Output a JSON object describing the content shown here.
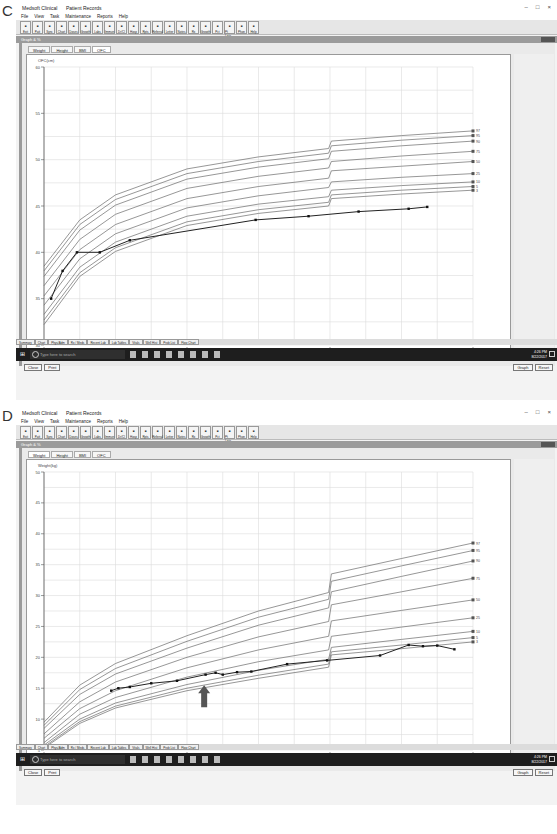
{
  "panels": [
    {
      "letter": "C",
      "app": {
        "title": "Medsoft Clinical",
        "subtitle": "Patient Records",
        "window_controls": [
          "–",
          "□",
          "×"
        ],
        "menu": [
          "File",
          "View",
          "Task",
          "Maintenance",
          "Reports",
          "Help"
        ],
        "toolbar": [
          "Exit",
          "Patt",
          "Sync",
          "Chart",
          "Doses",
          "Growth",
          "Labs",
          "Immun",
          "Dr/Cl",
          "Hosp",
          "Rpts",
          "Referral",
          "Letter",
          "Notes",
          "Rx",
          "Growth",
          "Pct",
          "Pt Lists",
          "Phon",
          "Help"
        ],
        "graph_window_title": "Graph & %",
        "tabs": [
          "Weight",
          "Height",
          "BMI",
          "OFC"
        ],
        "active_tab": "OFC",
        "status_line": "R. R.  ID: ###   DOB: 07/30/2015   Sex: M   08/22/17",
        "buttons_left": [
          "Close",
          "Print"
        ],
        "buttons_right": [
          "Graph",
          "Reset"
        ],
        "bottom_tabs": [
          "Summary",
          "Chart",
          "Phys/Adm",
          "Rx / Meds",
          "Recent Lab",
          "Lab Tables",
          "Vitals",
          "Well Hist",
          "Prob List",
          "Flow Chart"
        ],
        "taskbar": {
          "search_placeholder": "Type here to search",
          "time": "4:26 PM",
          "date": "8/22/2017"
        }
      }
    },
    {
      "letter": "D",
      "app": {
        "title": "Medsoft Clinical",
        "subtitle": "Patient Records",
        "window_controls": [
          "–",
          "□",
          "×"
        ],
        "menu": [
          "File",
          "View",
          "Task",
          "Maintenance",
          "Reports",
          "Help"
        ],
        "toolbar": [
          "Exit",
          "Patt",
          "Sync",
          "Chart",
          "Doses",
          "Growth",
          "Labs",
          "Immun",
          "Dr/Cl",
          "Hosp",
          "Rpts",
          "Referral",
          "Letter",
          "Notes",
          "Rx",
          "Growth",
          "Pct",
          "Pt Lists",
          "Phon",
          "Help"
        ],
        "graph_window_title": "Graph & %",
        "tabs": [
          "Weight",
          "Height",
          "BMI",
          "OFC"
        ],
        "active_tab": "Weight",
        "status_line": "R. R.  ID: ###   DOB: 09/09/2011   Sex: M   08/22/17",
        "buttons_left": [
          "Close",
          "Print"
        ],
        "buttons_right": [
          "Graph",
          "Reset"
        ],
        "bottom_tabs": [
          "Summary",
          "Chart",
          "Phys/Adm",
          "Rx / Meds",
          "Recent Lab",
          "Lab Tables",
          "Vitals",
          "Well Hist",
          "Prob List",
          "Flow Chart"
        ],
        "taskbar": {
          "search_placeholder": "Type here to search",
          "time": "4:26 PM",
          "date": "8/22/2017"
        }
      }
    }
  ],
  "chart_data": [
    {
      "panel": "C",
      "type": "line",
      "title": "OFC growth chart",
      "ylabel": "OFC(cm)",
      "xlabel": "Age(years)",
      "ylim": [
        30,
        60
      ],
      "xlim": [
        0,
        3
      ],
      "y_ticks": [
        30,
        35,
        40,
        45,
        50,
        55,
        60
      ],
      "x_ticks": [
        0,
        1,
        2,
        3
      ],
      "grid": true,
      "legend_position": "right-end labels",
      "percentile_labels": [
        "97",
        "95",
        "90",
        "75",
        "50",
        "25",
        "10",
        "5",
        "3"
      ],
      "x": [
        0,
        0.25,
        0.5,
        1,
        1.5,
        1.99,
        2.01,
        2.5,
        3
      ],
      "series": [
        {
          "name": "97",
          "values": [
            38.5,
            43.5,
            46.2,
            49.0,
            50.3,
            51.2,
            52.0,
            52.6,
            53.1
          ]
        },
        {
          "name": "95",
          "values": [
            38.0,
            43.0,
            45.7,
            48.5,
            49.8,
            50.7,
            51.5,
            52.1,
            52.6
          ]
        },
        {
          "name": "90",
          "values": [
            37.4,
            42.4,
            45.1,
            47.9,
            49.2,
            50.1,
            50.9,
            51.5,
            52.0
          ]
        },
        {
          "name": "75",
          "values": [
            36.4,
            41.4,
            44.1,
            46.9,
            48.2,
            49.1,
            49.8,
            50.4,
            50.9
          ]
        },
        {
          "name": "50",
          "values": [
            35.3,
            40.3,
            43.0,
            45.8,
            47.1,
            48.0,
            48.8,
            49.3,
            49.8
          ]
        },
        {
          "name": "25",
          "values": [
            34.3,
            39.3,
            42.0,
            44.8,
            46.1,
            47.0,
            47.6,
            48.1,
            48.5
          ]
        },
        {
          "name": "10",
          "values": [
            33.3,
            38.4,
            41.1,
            43.9,
            45.2,
            46.0,
            46.7,
            47.2,
            47.6
          ]
        },
        {
          "name": "5",
          "values": [
            32.7,
            37.8,
            40.5,
            43.3,
            44.6,
            45.4,
            46.2,
            46.7,
            47.1
          ]
        },
        {
          "name": "3",
          "values": [
            32.2,
            37.4,
            40.1,
            42.9,
            44.2,
            45.0,
            45.8,
            46.3,
            46.7
          ]
        }
      ],
      "patient": {
        "name": "Patient OFC",
        "x": [
          0.05,
          0.13,
          0.23,
          0.39,
          0.6,
          1.48,
          1.85,
          2.2,
          2.55,
          2.68
        ],
        "y": [
          35.0,
          38.0,
          40.0,
          40.0,
          41.3,
          43.5,
          43.9,
          44.4,
          44.7,
          44.9
        ]
      }
    },
    {
      "panel": "D",
      "type": "line",
      "title": "Weight growth chart",
      "ylabel": "Weight(kg)",
      "xlabel": "Age(years)",
      "ylim": [
        5,
        50
      ],
      "xlim": [
        0,
        3
      ],
      "y_ticks": [
        5,
        10,
        15,
        20,
        25,
        30,
        35,
        40,
        45,
        50
      ],
      "x_ticks": [
        0,
        1,
        2,
        3
      ],
      "grid": true,
      "legend_position": "right-end labels",
      "percentile_labels": [
        "97",
        "95",
        "90",
        "75",
        "50",
        "25",
        "10",
        "5",
        "3"
      ],
      "annotations": [
        {
          "type": "arrow",
          "x": 1.12,
          "y": 15.5,
          "direction": "up"
        }
      ],
      "x": [
        0,
        0.25,
        0.5,
        1,
        1.5,
        1.99,
        2.01,
        2.5,
        3
      ],
      "series": [
        {
          "name": "97",
          "values": [
            9.5,
            15.5,
            19.0,
            23.5,
            27.5,
            30.5,
            33.5,
            36.0,
            38.5
          ]
        },
        {
          "name": "95",
          "values": [
            9.0,
            14.8,
            18.2,
            22.6,
            26.5,
            29.4,
            32.3,
            34.8,
            37.3
          ]
        },
        {
          "name": "90",
          "values": [
            8.5,
            14.0,
            17.3,
            21.5,
            25.2,
            28.0,
            30.6,
            33.1,
            35.6
          ]
        },
        {
          "name": "75",
          "values": [
            7.6,
            12.8,
            16.0,
            20.0,
            23.3,
            25.8,
            28.5,
            30.6,
            32.8
          ]
        },
        {
          "name": "50",
          "values": [
            6.9,
            11.7,
            14.6,
            18.3,
            21.2,
            23.4,
            25.9,
            27.6,
            29.3
          ]
        },
        {
          "name": "25",
          "values": [
            6.2,
            10.8,
            13.5,
            16.8,
            19.3,
            21.2,
            23.4,
            24.9,
            26.4
          ]
        },
        {
          "name": "10",
          "values": [
            5.8,
            10.0,
            12.6,
            15.6,
            17.9,
            19.7,
            21.6,
            22.9,
            24.2
          ]
        },
        {
          "name": "5",
          "values": [
            5.5,
            9.6,
            12.1,
            15.0,
            17.1,
            18.9,
            20.9,
            22.0,
            23.2
          ]
        },
        {
          "name": "3",
          "values": [
            5.3,
            9.3,
            11.8,
            14.6,
            16.6,
            18.4,
            20.4,
            21.4,
            22.5
          ]
        }
      ],
      "patient": {
        "name": "Patient weight",
        "x": [
          0.47,
          0.52,
          0.6,
          0.75,
          0.93,
          1.13,
          1.2,
          1.25,
          1.35,
          1.45,
          1.7,
          1.98,
          2.35,
          2.55,
          2.65,
          2.75,
          2.87
        ],
        "y": [
          14.6,
          15.0,
          15.2,
          15.8,
          16.2,
          17.2,
          17.5,
          17.2,
          17.6,
          17.7,
          18.9,
          19.5,
          20.3,
          22.0,
          21.8,
          21.9,
          21.3
        ]
      }
    }
  ]
}
